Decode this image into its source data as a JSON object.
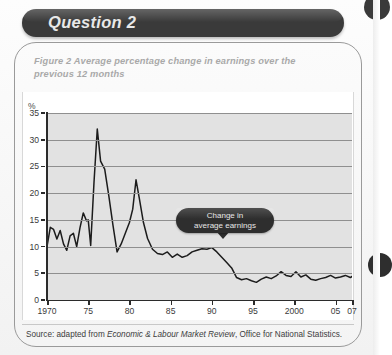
{
  "header": {
    "title": "Question 2"
  },
  "figure": {
    "caption": "Figure 2  Average percentage change in earnings over the previous 12 months",
    "axis_percent_label": "%",
    "callout": {
      "line1": "Change in",
      "line2": "average earnings"
    },
    "source_prefix": "Source: adapted from ",
    "source_italic": "Economic & Labour Market Review",
    "source_suffix": ", Office for National Statistics."
  },
  "colors": {
    "header_pill": "#3a3a3a",
    "plot_background": "#e2e2e2",
    "gridline": "#8f8f8f",
    "series_line": "#1c1c1c",
    "caption_text": "#a9a9a9",
    "callout_background": "#2e2e2e"
  },
  "chart_data": {
    "type": "line",
    "title": "Figure 2  Average percentage change in earnings over the previous 12 months",
    "xlabel": "",
    "ylabel": "%",
    "ylim": [
      0,
      35
    ],
    "xlim": [
      1970,
      2007
    ],
    "ytick_labels": [
      "0",
      "5",
      "10",
      "15",
      "20",
      "25",
      "30",
      "35"
    ],
    "ytick_values": [
      0,
      5,
      10,
      15,
      20,
      25,
      30,
      35
    ],
    "xtick_labels": [
      "1970",
      "75",
      "80",
      "85",
      "90",
      "95",
      "2000",
      "05",
      "07"
    ],
    "xtick_values": [
      1970,
      1975,
      1980,
      1985,
      1990,
      1995,
      2000,
      2005,
      2007
    ],
    "grid": true,
    "legend": "Change in average earnings",
    "annotations": [
      {
        "text": "Change in average earnings",
        "x": 1987.5,
        "y": 17.5
      }
    ],
    "series": [
      {
        "name": "Change in average earnings",
        "x": [
          1970.0,
          1970.4,
          1970.8,
          1971.2,
          1971.6,
          1972.0,
          1972.4,
          1972.8,
          1973.2,
          1973.6,
          1974.0,
          1974.4,
          1974.8,
          1975.0,
          1975.3,
          1975.7,
          1976.1,
          1976.5,
          1977.0,
          1977.5,
          1978.0,
          1978.5,
          1979.0,
          1979.5,
          1980.0,
          1980.4,
          1980.8,
          1981.2,
          1981.7,
          1982.2,
          1982.8,
          1983.4,
          1984.0,
          1984.6,
          1985.2,
          1985.8,
          1986.4,
          1987.0,
          1987.6,
          1988.2,
          1988.8,
          1989.4,
          1990.0,
          1990.6,
          1991.2,
          1991.8,
          1992.4,
          1993.0,
          1993.6,
          1994.2,
          1994.8,
          1995.4,
          1996.0,
          1996.6,
          1997.2,
          1997.8,
          1998.4,
          1999.0,
          1999.6,
          2000.2,
          2000.8,
          2001.4,
          2002.0,
          2002.6,
          2003.2,
          2003.8,
          2004.4,
          2005.0,
          2005.6,
          2006.2,
          2006.8,
          2007.0
        ],
        "y": [
          10.0,
          13.6,
          13.2,
          11.4,
          13.0,
          10.5,
          9.3,
          12.0,
          12.5,
          10.0,
          13.5,
          16.3,
          14.8,
          15.0,
          10.2,
          22.0,
          32.0,
          26.0,
          24.5,
          19.5,
          14.0,
          9.0,
          10.5,
          12.5,
          14.5,
          17.0,
          22.5,
          19.0,
          14.5,
          11.5,
          9.5,
          8.7,
          8.5,
          9.0,
          8.0,
          8.6,
          8.0,
          8.3,
          9.0,
          9.3,
          9.6,
          9.5,
          9.8,
          9.0,
          8.0,
          7.0,
          6.0,
          4.2,
          3.8,
          4.0,
          3.6,
          3.3,
          3.9,
          4.3,
          4.0,
          4.5,
          5.3,
          4.6,
          4.4,
          5.3,
          4.3,
          4.7,
          3.9,
          3.7,
          4.0,
          4.2,
          4.6,
          4.1,
          4.3,
          4.6,
          4.2,
          4.4
        ]
      }
    ]
  }
}
